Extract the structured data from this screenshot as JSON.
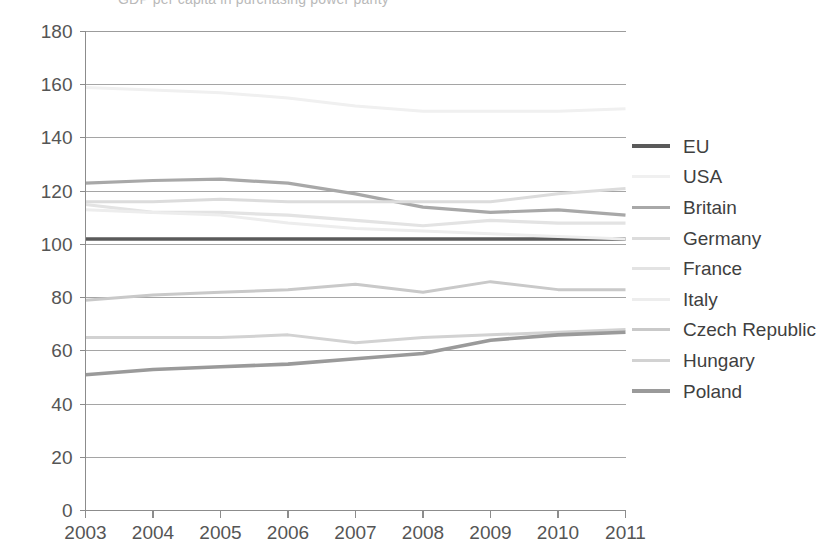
{
  "caption": {
    "clipped_top_text": "GDP per capita in purchasing power parity"
  },
  "axes": {
    "y_ticks": [
      "0",
      "20",
      "40",
      "60",
      "80",
      "100",
      "120",
      "140",
      "160",
      "180"
    ],
    "x_ticks": [
      "2003",
      "2004",
      "2005",
      "2006",
      "2007",
      "2008",
      "2009",
      "2010",
      "2011"
    ],
    "y_min": 0,
    "y_max": 180,
    "y_step": 20,
    "gridlines": "horizontal"
  },
  "legend": {
    "position": "right",
    "items": [
      {
        "label": "EU",
        "color": "#5a5a5a",
        "width": 3.4
      },
      {
        "label": "USA",
        "color": "#f0f0f0",
        "width": 3.0
      },
      {
        "label": "Britain",
        "color": "#a8a8a8",
        "width": 3.2
      },
      {
        "label": "Germany",
        "color": "#dcdcdc",
        "width": 3.0
      },
      {
        "label": "France",
        "color": "#e3e3e3",
        "width": 3.2
      },
      {
        "label": "Italy",
        "color": "#ededed",
        "width": 3.0
      },
      {
        "label": "Czech Republic",
        "color": "#c9c9c9",
        "width": 3.0
      },
      {
        "label": "Hungary",
        "color": "#d2d2d2",
        "width": 3.0
      },
      {
        "label": "Poland",
        "color": "#9a9a9a",
        "width": 3.6
      }
    ]
  },
  "chart_data": {
    "type": "line",
    "title": "",
    "subtitle": "",
    "xlabel": "",
    "ylabel": "",
    "x": [
      2003,
      2004,
      2005,
      2006,
      2007,
      2008,
      2009,
      2010,
      2011
    ],
    "categories": [
      "2003",
      "2004",
      "2005",
      "2006",
      "2007",
      "2008",
      "2009",
      "2010",
      "2011"
    ],
    "ylim": [
      0,
      180
    ],
    "ytick_step": 20,
    "grid": true,
    "legend_position": "right",
    "series": [
      {
        "name": "EU",
        "color": "#5a5a5a",
        "values": [
          102,
          102,
          102,
          102,
          102,
          102,
          102,
          102,
          102
        ]
      },
      {
        "name": "USA",
        "color": "#f0f0f0",
        "values": [
          159,
          158,
          157,
          155,
          152,
          150,
          150,
          150,
          151
        ]
      },
      {
        "name": "Britain",
        "color": "#a8a8a8",
        "values": [
          123,
          124,
          124.5,
          123,
          119,
          114,
          112,
          113,
          111
        ]
      },
      {
        "name": "Germany",
        "color": "#dcdcdc",
        "values": [
          116,
          116,
          117,
          116,
          116,
          116,
          116,
          119,
          121
        ]
      },
      {
        "name": "France",
        "color": "#e3e3e3",
        "values": [
          115,
          112,
          112,
          111,
          109,
          107,
          109,
          108,
          108
        ]
      },
      {
        "name": "Italy",
        "color": "#ededed",
        "values": [
          113,
          112,
          111,
          108,
          106,
          105,
          104,
          103,
          102
        ]
      },
      {
        "name": "Czech Republic",
        "color": "#c9c9c9",
        "values": [
          79,
          81,
          82,
          83,
          85,
          82,
          86,
          83,
          83
        ]
      },
      {
        "name": "Hungary",
        "color": "#d2d2d2",
        "values": [
          65,
          65,
          65,
          66,
          63,
          65,
          66,
          67,
          68
        ]
      },
      {
        "name": "Poland",
        "color": "#9a9a9a",
        "values": [
          51,
          53,
          54,
          55,
          57,
          59,
          64,
          66,
          67
        ]
      }
    ]
  }
}
